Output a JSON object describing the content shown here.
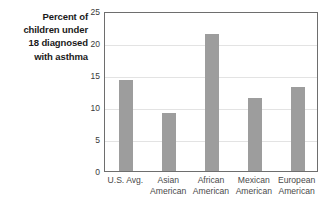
{
  "chart_data": {
    "type": "bar",
    "title": "Percent of children under 18 diagnosed with asthma",
    "title_lines": [
      "Percent of",
      "children under",
      "18 diagnosed",
      "with asthma"
    ],
    "xlabel": "",
    "ylabel": "",
    "ylim": [
      0,
      25
    ],
    "yticks": [
      0,
      5,
      10,
      15,
      20,
      25
    ],
    "ytick_labels": [
      "0",
      "5",
      "10",
      "15",
      "20",
      "25"
    ],
    "grid": true,
    "legend": false,
    "categories": [
      "U.S. Avg.",
      "Asian American",
      "African American",
      "Mexican American",
      "European American"
    ],
    "category_lines": [
      [
        "U.S. Avg."
      ],
      [
        "Asian",
        "American"
      ],
      [
        "African",
        "American"
      ],
      [
        "Mexican",
        "American"
      ],
      [
        "European",
        "American"
      ]
    ],
    "values": [
      14.2,
      9.1,
      21.4,
      11.4,
      13.2
    ],
    "bar_color": "#9d9d9d",
    "grid_color": "#e3e3e3",
    "frame_color": "#6e6e6e",
    "text_color": "#4a4a4a",
    "title_color": "#1a1a1a"
  }
}
